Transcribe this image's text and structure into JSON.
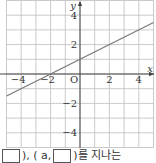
{
  "chart_data": {
    "type": "line",
    "title": "",
    "xlabel": "x",
    "ylabel": "y",
    "origin_label": "O",
    "xlim": [
      -5,
      5
    ],
    "ylim": [
      -5,
      5
    ],
    "grid": true,
    "grid_step": 1,
    "x_ticks": [
      {
        "value": -4,
        "label": "−4"
      },
      {
        "value": -2,
        "label": "−2"
      },
      {
        "value": 2,
        "label": "2"
      },
      {
        "value": 4,
        "label": "4"
      }
    ],
    "y_ticks": [
      {
        "value": 4,
        "label": "4"
      },
      {
        "value": 2,
        "label": "2"
      },
      {
        "value": -2,
        "label": "−2"
      },
      {
        "value": -4,
        "label": "−4"
      }
    ],
    "series": [
      {
        "name": "y = x/2 + 1",
        "x": [
          -5,
          -2,
          0,
          5
        ],
        "y": [
          -1.5,
          0,
          1,
          3.5
        ],
        "slope": 0.5,
        "intercept": 1
      }
    ],
    "legend": "none"
  },
  "caption": {
    "part1": "), (",
    "part2": "a,",
    "part3": ")를 지나는"
  },
  "colors": {
    "grid": "#bdbdbd",
    "axis": "#444444",
    "line": "#777777",
    "text": "#333333"
  }
}
